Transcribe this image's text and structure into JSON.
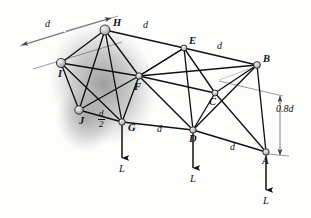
{
  "figure": {
    "type": "engineering-truss-diagram",
    "colors": {
      "member": "#111111",
      "node_fill": "#cfcfcf",
      "node_stroke": "#111111",
      "dimension": "#3a3a3a",
      "shadow": "#9a9a9a",
      "background": "#fdfdfc"
    },
    "nodes": [
      {
        "id": "H",
        "label": "H",
        "x": 105,
        "y": 30,
        "r": 5.0,
        "label_dx": 8,
        "label_dy": -4
      },
      {
        "id": "I",
        "label": "I",
        "x": 61,
        "y": 63,
        "r": 4.6,
        "label_dx": -3,
        "label_dy": 14
      },
      {
        "id": "J",
        "label": "J",
        "x": 79,
        "y": 110,
        "r": 4.2,
        "label_dx": 0,
        "label_dy": 14
      },
      {
        "id": "G",
        "label": "G",
        "x": 122,
        "y": 122,
        "r": 3.2,
        "label_dx": 6,
        "label_dy": 9
      },
      {
        "id": "F",
        "label": "F",
        "x": 139,
        "y": 76,
        "r": 3.2,
        "label_dx": -5,
        "label_dy": 14
      },
      {
        "id": "E",
        "label": "E",
        "x": 184,
        "y": 48,
        "r": 3.0,
        "label_dx": 5,
        "label_dy": -4
      },
      {
        "id": "D",
        "label": "D",
        "x": 193,
        "y": 130,
        "r": 3.2,
        "label_dx": -4,
        "label_dy": 12
      },
      {
        "id": "C",
        "label": "C",
        "x": 215,
        "y": 93,
        "r": 3.0,
        "label_dx": -6,
        "label_dy": 12
      },
      {
        "id": "B",
        "label": "B",
        "x": 257,
        "y": 65,
        "r": 3.4,
        "label_dx": 6,
        "label_dy": -3
      },
      {
        "id": "A",
        "label": "A",
        "x": 266,
        "y": 152,
        "r": 3.2,
        "label_dx": -4,
        "label_dy": 12
      }
    ],
    "members": [
      [
        "H",
        "I"
      ],
      [
        "H",
        "E"
      ],
      [
        "H",
        "F"
      ],
      [
        "H",
        "G"
      ],
      [
        "H",
        "J"
      ],
      [
        "I",
        "F"
      ],
      [
        "I",
        "J"
      ],
      [
        "I",
        "G"
      ],
      [
        "J",
        "G"
      ],
      [
        "J",
        "F"
      ],
      [
        "G",
        "F"
      ],
      [
        "G",
        "D"
      ],
      [
        "F",
        "E"
      ],
      [
        "F",
        "B"
      ],
      [
        "F",
        "C"
      ],
      [
        "F",
        "D"
      ],
      [
        "E",
        "B"
      ],
      [
        "E",
        "C"
      ],
      [
        "E",
        "D"
      ],
      [
        "E",
        "F"
      ],
      [
        "C",
        "B"
      ],
      [
        "C",
        "D"
      ],
      [
        "C",
        "A"
      ],
      [
        "B",
        "A"
      ],
      [
        "B",
        "D"
      ],
      [
        "D",
        "A"
      ]
    ],
    "loads": [
      {
        "at": "G",
        "label": "L",
        "length": 36
      },
      {
        "at": "D",
        "label": "L",
        "length": 38
      },
      {
        "at": "A",
        "label": "L",
        "length": 38
      }
    ],
    "dimensions": [
      {
        "id": "d-top-left",
        "label": "d",
        "kind": "plain",
        "x": 45,
        "y": 25
      },
      {
        "id": "d-HE",
        "label": "d",
        "kind": "plain",
        "x": 143,
        "y": 26
      },
      {
        "id": "d-EB",
        "label": "d",
        "kind": "plain",
        "x": 217,
        "y": 47
      },
      {
        "id": "d-half-JG",
        "label": "d/2",
        "kind": "fraction",
        "numerator": "d",
        "denominator": "2",
        "x": 98,
        "y": 118
      },
      {
        "id": "d-GD",
        "label": "d",
        "kind": "plain",
        "x": 157,
        "y": 130
      },
      {
        "id": "d-DA",
        "label": "d",
        "kind": "plain",
        "x": 230,
        "y": 148
      },
      {
        "id": "h-0.8d",
        "label": "0.8d",
        "kind": "plain",
        "x": 276,
        "y": 110
      }
    ]
  }
}
